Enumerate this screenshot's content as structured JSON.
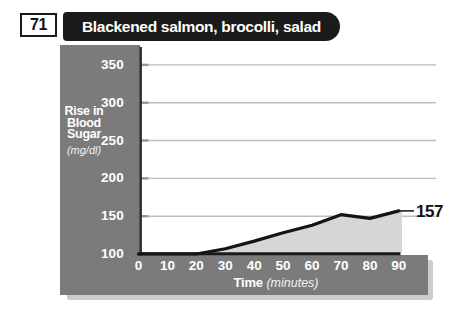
{
  "header": {
    "gi_value": "71",
    "meal_title": "Blackened salmon, brocolli, salad"
  },
  "chart_data": {
    "type": "area",
    "title": "Blackened salmon, brocolli, salad",
    "x": [
      0,
      10,
      20,
      30,
      40,
      50,
      60,
      70,
      80,
      90
    ],
    "values": [
      100,
      100,
      100,
      107,
      117,
      128,
      138,
      152,
      147,
      157
    ],
    "end_label": "157",
    "xlabel": "Time",
    "xlabel_unit": "(minutes)",
    "xticks": [
      0,
      10,
      20,
      30,
      40,
      50,
      60,
      70,
      80,
      90
    ],
    "yticks": [
      350,
      300,
      250,
      200,
      150,
      100
    ],
    "xlim": [
      0,
      90
    ],
    "ylim": [
      100,
      375
    ],
    "ylabel_lines": [
      "Rise in",
      "Blood",
      "Sugar"
    ],
    "ylabel_unit": "(mg/dl)",
    "grid": true,
    "legend_position": "none"
  },
  "colors": {
    "banner_bg": "#1b1b1b",
    "band_bg": "#7b7b7b",
    "area_fill": "#d6d6d6",
    "line": "#141414",
    "gridline": "#bdbdbd",
    "tick_nub": "#979797",
    "axis": "#1a1a1a",
    "shadow": "#cccccc",
    "text_on_band": "#ffffff"
  }
}
